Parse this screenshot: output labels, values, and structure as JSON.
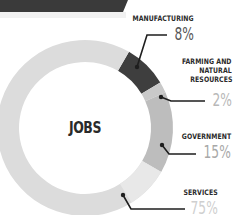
{
  "chart_data": {
    "type": "pie",
    "subtype": "donut",
    "title": "JOBS",
    "categories": [
      "Manufacturing",
      "Farming and Natural Resources",
      "Government",
      "Services"
    ],
    "values": [
      8,
      2,
      15,
      75
    ],
    "unit": "%",
    "colors": [
      "#3e3e3e",
      "#c9c9c9",
      "#bdbdbd",
      "#dcdcdc"
    ],
    "legend_position": "right (callout labels)"
  },
  "center": {
    "label": "JOBS"
  },
  "labels": {
    "manufacturing": {
      "name": "MANUFACTURING",
      "pct": "8%",
      "color": "#555555"
    },
    "farming": {
      "line1": "FARMING AND",
      "line2": "NATURAL",
      "line3": "RESOURCES",
      "pct": "2%",
      "color": "#b8b8b8"
    },
    "government": {
      "name": "GOVERNMENT",
      "pct": "15%",
      "color": "#a8a8a8"
    },
    "services": {
      "name": "SERVICES",
      "pct": "75%",
      "color": "#cfcfcf"
    }
  }
}
